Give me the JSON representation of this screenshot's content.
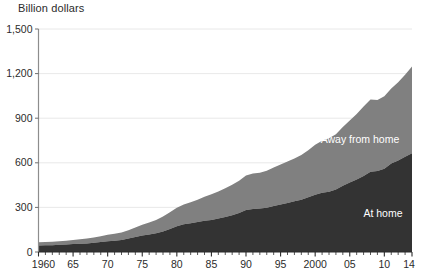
{
  "chart_data": {
    "type": "area",
    "stacked": true,
    "title": "",
    "ylabel": "Billion dollars",
    "xlabel": "",
    "grid": true,
    "legend_position": "inline-labels",
    "ylim": [
      0,
      1500
    ],
    "yticks": [
      0,
      300,
      600,
      900,
      1200,
      1500
    ],
    "ytick_labels": [
      "0",
      "300",
      "600",
      "900",
      "1,200",
      "1,500"
    ],
    "xlim": [
      1960,
      2014
    ],
    "xticks": [
      1960,
      1965,
      1970,
      1975,
      1980,
      1985,
      1990,
      1995,
      2000,
      2005,
      2010,
      2014
    ],
    "xtick_labels": [
      "1960",
      "65",
      "70",
      "75",
      "80",
      "85",
      "90",
      "95",
      "2000",
      "05",
      "10",
      "14"
    ],
    "minor_tick_interval": 1,
    "x": [
      1960,
      1961,
      1962,
      1963,
      1964,
      1965,
      1966,
      1967,
      1968,
      1969,
      1970,
      1971,
      1972,
      1973,
      1974,
      1975,
      1976,
      1977,
      1978,
      1979,
      1980,
      1981,
      1982,
      1983,
      1984,
      1985,
      1986,
      1987,
      1988,
      1989,
      1990,
      1991,
      1992,
      1993,
      1994,
      1995,
      1996,
      1997,
      1998,
      1999,
      2000,
      2001,
      2002,
      2003,
      2004,
      2005,
      2006,
      2007,
      2008,
      2009,
      2010,
      2011,
      2012,
      2013,
      2014
    ],
    "series": [
      {
        "name": "At home",
        "label": "At home",
        "color": "#333333",
        "label_color": "#ffffff",
        "values": [
          44,
          45,
          46,
          48,
          50,
          53,
          56,
          58,
          62,
          67,
          73,
          76,
          81,
          90,
          101,
          111,
          118,
          126,
          138,
          155,
          173,
          186,
          194,
          202,
          210,
          216,
          226,
          236,
          247,
          262,
          283,
          290,
          292,
          298,
          310,
          320,
          330,
          341,
          352,
          368,
          385,
          398,
          405,
          420,
          445,
          467,
          487,
          512,
          540,
          545,
          560,
          595,
          615,
          640,
          665
        ]
      },
      {
        "name": "Away from home",
        "label": "Away from home",
        "color": "#808080",
        "label_color": "#ffffff",
        "values": [
          21,
          22,
          23,
          24,
          26,
          28,
          30,
          32,
          35,
          39,
          43,
          46,
          51,
          57,
          64,
          72,
          81,
          89,
          100,
          113,
          124,
          133,
          141,
          150,
          162,
          172,
          181,
          193,
          205,
          218,
          232,
          238,
          241,
          248,
          259,
          268,
          278,
          288,
          300,
          317,
          337,
          350,
          360,
          372,
          395,
          418,
          441,
          466,
          486,
          478,
          487,
          505,
          527,
          553,
          583
        ]
      }
    ],
    "totals": [
      65,
      67,
      69,
      72,
      76,
      81,
      86,
      90,
      97,
      106,
      116,
      122,
      132,
      147,
      165,
      183,
      199,
      215,
      238,
      268,
      297,
      319,
      335,
      352,
      372,
      388,
      407,
      429,
      452,
      480,
      515,
      528,
      533,
      546,
      569,
      588,
      608,
      629,
      652,
      685,
      722,
      748,
      765,
      792,
      840,
      885,
      928,
      978,
      1026,
      1023,
      1047,
      1100,
      1142,
      1193,
      1248
    ]
  }
}
